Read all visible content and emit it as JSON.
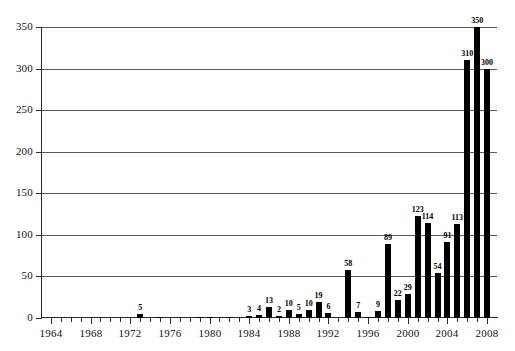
{
  "chart_data": {
    "type": "bar",
    "title": "",
    "subtitle": "",
    "xlabel": "",
    "ylabel": "",
    "xlim": [
      1963,
      2009
    ],
    "ylim": [
      0,
      350
    ],
    "grid": true,
    "legend": null,
    "y_ticks": [
      0,
      50,
      100,
      150,
      200,
      250,
      300,
      350
    ],
    "x_ticks_major": [
      1964,
      1968,
      1972,
      1976,
      1980,
      1984,
      1988,
      1992,
      1996,
      2000,
      2004,
      2008
    ],
    "x_tick_step_minor": 1,
    "bar_color": "#000000",
    "categories": [
      1964,
      1965,
      1966,
      1967,
      1968,
      1969,
      1970,
      1971,
      1972,
      1973,
      1974,
      1975,
      1976,
      1977,
      1978,
      1979,
      1980,
      1981,
      1982,
      1983,
      1984,
      1985,
      1986,
      1987,
      1988,
      1989,
      1990,
      1991,
      1992,
      1993,
      1994,
      1995,
      1996,
      1997,
      1998,
      1999,
      2000,
      2001,
      2002,
      2003,
      2004,
      2005,
      2006,
      2007,
      2008
    ],
    "values": [
      0,
      0,
      0,
      0,
      0,
      0,
      0,
      0,
      0,
      5,
      0,
      1,
      0,
      0,
      0,
      1,
      1,
      0,
      1,
      0,
      3,
      4,
      13,
      2,
      10,
      5,
      10,
      19,
      6,
      0,
      58,
      7,
      1,
      9,
      89,
      22,
      29,
      123,
      114,
      54,
      91,
      113,
      310,
      350,
      300
    ],
    "labeled_points": [
      {
        "x": 1973,
        "value": 5,
        "label": "5"
      },
      {
        "x": 1984,
        "value": 3,
        "label": "3"
      },
      {
        "x": 1985,
        "value": 4,
        "label": "4"
      },
      {
        "x": 1986,
        "value": 13,
        "label": "13"
      },
      {
        "x": 1987,
        "value": 2,
        "label": "2"
      },
      {
        "x": 1988,
        "value": 10,
        "label": "10"
      },
      {
        "x": 1989,
        "value": 5,
        "label": "5"
      },
      {
        "x": 1990,
        "value": 10,
        "label": "10"
      },
      {
        "x": 1991,
        "value": 19,
        "label": "19"
      },
      {
        "x": 1992,
        "value": 6,
        "label": "6"
      },
      {
        "x": 1994,
        "value": 58,
        "label": "58"
      },
      {
        "x": 1995,
        "value": 7,
        "label": "7"
      },
      {
        "x": 1997,
        "value": 9,
        "label": "9"
      },
      {
        "x": 1998,
        "value": 89,
        "label": "89"
      },
      {
        "x": 1999,
        "value": 22,
        "label": "22"
      },
      {
        "x": 2000,
        "value": 29,
        "label": "29"
      },
      {
        "x": 2001,
        "value": 123,
        "label": "123"
      },
      {
        "x": 2002,
        "value": 114,
        "label": "114"
      },
      {
        "x": 2003,
        "value": 54,
        "label": "54"
      },
      {
        "x": 2004,
        "value": 91,
        "label": "91"
      },
      {
        "x": 2005,
        "value": 113,
        "label": "113"
      },
      {
        "x": 2006,
        "value": 310,
        "label": "310"
      },
      {
        "x": 2007,
        "value": 350,
        "label": "350"
      },
      {
        "x": 2008,
        "value": 300,
        "label": "300"
      }
    ]
  }
}
